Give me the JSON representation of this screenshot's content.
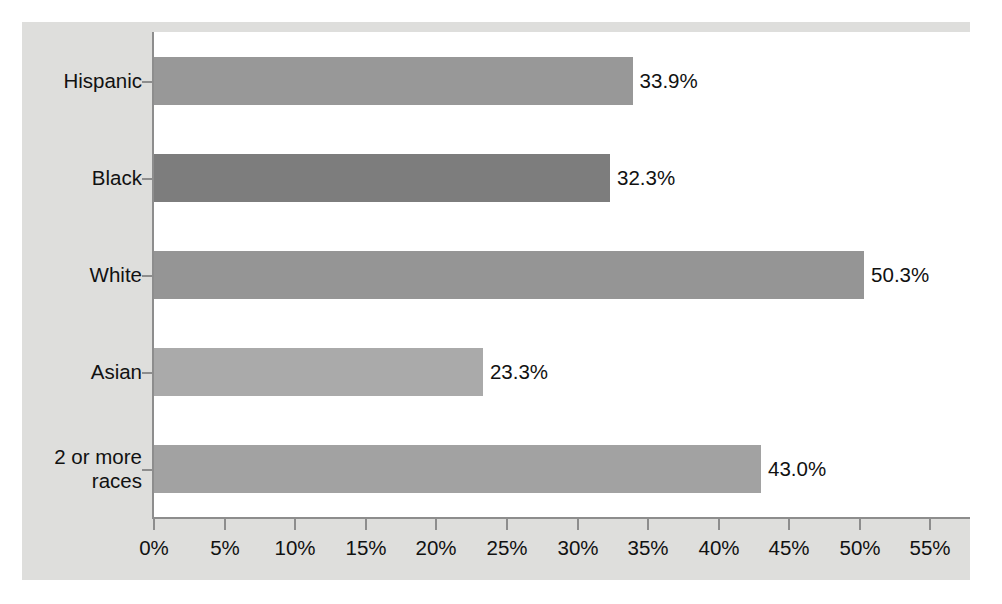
{
  "chart_data": {
    "type": "bar",
    "orientation": "horizontal",
    "title": "",
    "subtitle": "",
    "xlabel": "",
    "ylabel": "",
    "categories": [
      "Hispanic",
      "Black",
      "White",
      "Asian",
      "2 or more\nraces"
    ],
    "values": [
      33.9,
      32.3,
      50.3,
      23.3,
      43.0
    ],
    "value_labels": [
      "33.9%",
      "32.3%",
      "50.3%",
      "23.3%",
      "43.0%"
    ],
    "bar_colors": [
      "#989898",
      "#7d7d7d",
      "#959595",
      "#aaaaaa",
      "#a2a2a2"
    ],
    "xlim": [
      0,
      57.8
    ],
    "xticks": [
      0,
      5,
      10,
      15,
      20,
      25,
      30,
      35,
      40,
      45,
      50,
      55
    ],
    "xtick_labels": [
      "0%",
      "5%",
      "10%",
      "15%",
      "20%",
      "25%",
      "30%",
      "35%",
      "40%",
      "45%",
      "50%",
      "55%"
    ],
    "grid": false,
    "legend": null,
    "legend_position": "none",
    "annotations": []
  },
  "figure": {
    "panel_background": "#dededc",
    "plot_background": "#ffffff",
    "axis_color": "#8d8d8d",
    "text_color": "#111111"
  }
}
